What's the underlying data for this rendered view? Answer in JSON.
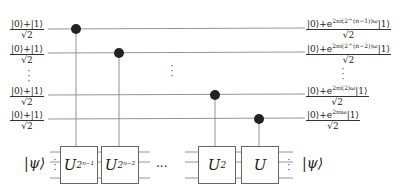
{
  "diagram": {
    "type": "quantum-circuit",
    "input_qubits": [
      {
        "label_num": "|0⟩+|1⟩",
        "label_den": "√2"
      },
      {
        "label_num": "|0⟩+|1⟩",
        "label_den": "√2"
      },
      {
        "label_num": "|0⟩+|1⟩",
        "label_den": "√2"
      },
      {
        "label_num": "|0⟩+|1⟩",
        "label_den": "√2"
      }
    ],
    "output_qubits": [
      {
        "num_prefix": "|0⟩+e",
        "exponent": "2πi(2^(n−1))ω",
        "num_suffix": "|1⟩",
        "den": "√2"
      },
      {
        "num_prefix": "|0⟩+e",
        "exponent": "2πi(2^(n−2))ω",
        "num_suffix": "|1⟩",
        "den": "√2"
      },
      {
        "num_prefix": "|0⟩+e",
        "exponent": "2πi(2)ω",
        "num_suffix": "|1⟩",
        "den": "√2"
      },
      {
        "num_prefix": "|0⟩+e",
        "exponent": "2πiω",
        "num_suffix": "|1⟩",
        "den": "√2"
      }
    ],
    "gates": [
      {
        "base": "U",
        "exponent": "2ⁿ⁻¹",
        "control_qubit": 0
      },
      {
        "base": "U",
        "exponent": "2ⁿ⁻²",
        "control_qubit": 1
      },
      {
        "base": "U",
        "exponent": "2",
        "control_qubit": 2
      },
      {
        "base": "U",
        "exponent": "",
        "control_qubit": 3
      }
    ],
    "register_in": "|ψ⟩",
    "register_out": "|ψ⟩",
    "ellipsis_h": "···",
    "ellipsis_v": "⋮"
  }
}
